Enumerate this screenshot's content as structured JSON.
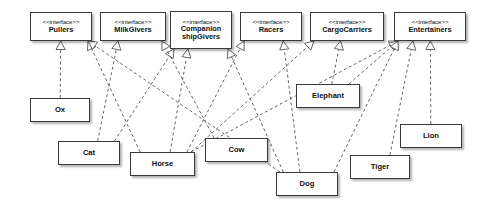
{
  "diagram": {
    "kind": "uml-class-diagram",
    "stereotype_label": "<<interface>>",
    "colors": {
      "box_fill": "#fefefe",
      "box_border": "#3a3a3a",
      "edge": "#555555",
      "text": "#111111",
      "background": "#ffffff"
    },
    "interfaces": [
      {
        "id": "pullers",
        "name": "Pullers",
        "lines": [
          "Pullers"
        ],
        "x": 30,
        "y": 12,
        "w": 62,
        "h": 29
      },
      {
        "id": "milkgivers",
        "name": "MilkGivers",
        "lines": [
          "MilkGivers"
        ],
        "x": 100,
        "y": 12,
        "w": 66,
        "h": 29
      },
      {
        "id": "companionship",
        "name": "CompanionshipGivers",
        "lines": [
          "Companion",
          "shipGivers"
        ],
        "x": 170,
        "y": 11,
        "w": 62,
        "h": 38
      },
      {
        "id": "racers",
        "name": "Racers",
        "lines": [
          "Racers"
        ],
        "x": 240,
        "y": 12,
        "w": 62,
        "h": 29
      },
      {
        "id": "cargocarriers",
        "name": "CargoCarriers",
        "lines": [
          "CargoCarriers"
        ],
        "x": 310,
        "y": 12,
        "w": 74,
        "h": 29
      },
      {
        "id": "entertainers",
        "name": "Entertainers",
        "lines": [
          "Entertainers"
        ],
        "x": 394,
        "y": 12,
        "w": 72,
        "h": 29
      }
    ],
    "classes": [
      {
        "id": "ox",
        "name": "Ox",
        "x": 30,
        "y": 98,
        "w": 60,
        "h": 24
      },
      {
        "id": "cat",
        "name": "Cat",
        "x": 58,
        "y": 141,
        "w": 62,
        "h": 24
      },
      {
        "id": "horse",
        "name": "Horse",
        "x": 130,
        "y": 152,
        "w": 65,
        "h": 24
      },
      {
        "id": "cow",
        "name": "Cow",
        "x": 205,
        "y": 138,
        "w": 63,
        "h": 24
      },
      {
        "id": "elephant",
        "name": "Elephant",
        "x": 296,
        "y": 84,
        "w": 64,
        "h": 24
      },
      {
        "id": "dog",
        "name": "Dog",
        "x": 276,
        "y": 172,
        "w": 62,
        "h": 24
      },
      {
        "id": "tiger",
        "name": "Tiger",
        "x": 350,
        "y": 155,
        "w": 60,
        "h": 24
      },
      {
        "id": "lion",
        "name": "Lion",
        "x": 400,
        "y": 124,
        "w": 62,
        "h": 24
      }
    ],
    "realizations": [
      {
        "from": "ox",
        "to": "pullers"
      },
      {
        "from": "cat",
        "to": "companionship"
      },
      {
        "from": "cat",
        "to": "milkgivers"
      },
      {
        "from": "horse",
        "to": "pullers"
      },
      {
        "from": "horse",
        "to": "companionship"
      },
      {
        "from": "horse",
        "to": "racers"
      },
      {
        "from": "horse",
        "to": "cargocarriers"
      },
      {
        "from": "horse",
        "to": "entertainers"
      },
      {
        "from": "cow",
        "to": "milkgivers"
      },
      {
        "from": "elephant",
        "to": "cargocarriers"
      },
      {
        "from": "elephant",
        "to": "entertainers"
      },
      {
        "from": "dog",
        "to": "pullers"
      },
      {
        "from": "dog",
        "to": "companionship"
      },
      {
        "from": "dog",
        "to": "racers"
      },
      {
        "from": "dog",
        "to": "entertainers"
      },
      {
        "from": "tiger",
        "to": "entertainers"
      },
      {
        "from": "lion",
        "to": "entertainers"
      }
    ]
  }
}
